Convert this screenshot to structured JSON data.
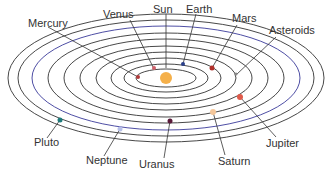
{
  "diagram": {
    "sun": {
      "label": "Sun",
      "color": "#f5b04a"
    },
    "orbit_color": "#333333",
    "bodies": [
      {
        "id": "mercury",
        "label": "Mercury",
        "color": "#b03a3a"
      },
      {
        "id": "venus",
        "label": "Venus",
        "color": "#d0606a"
      },
      {
        "id": "earth",
        "label": "Earth",
        "color": "#2a3f8a"
      },
      {
        "id": "mars",
        "label": "Mars",
        "color": "#b0302a"
      },
      {
        "id": "asteroids",
        "label": "Asteroids",
        "color": "#888888"
      },
      {
        "id": "jupiter",
        "label": "Jupiter",
        "color": "#e05a4a"
      },
      {
        "id": "saturn",
        "label": "Saturn",
        "color": "#f5c79a"
      },
      {
        "id": "uranus",
        "label": "Uranus",
        "color": "#5a1a3a"
      },
      {
        "id": "neptune",
        "label": "Neptune",
        "color": "#b8c0e8"
      },
      {
        "id": "pluto",
        "label": "Pluto",
        "color": "#1f7a7a"
      }
    ]
  }
}
